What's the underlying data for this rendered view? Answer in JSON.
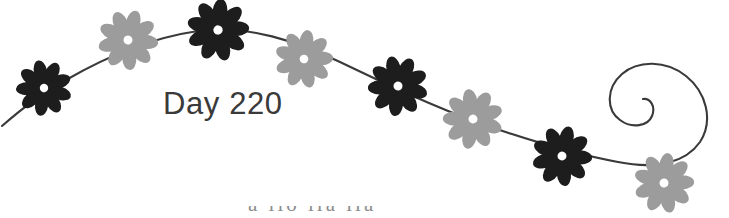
{
  "banner": {
    "title_text": "Day 220",
    "partial_footer_text": "a llo   lla  lla",
    "colors": {
      "background": "#ffffff",
      "dark_flower": "#1d1d1d",
      "light_flower": "#9c9c9c",
      "flower_center": "#ffffff",
      "vine_stroke": "#3a3a3a",
      "title_text": "#3a3a3a"
    },
    "vine": {
      "description": "s-curve-with-spiral",
      "path": "M 2 126 C 18 112 40 94 66 80 C 104 58 150 38 198 31 C 248 24 298 42 340 62 C 386 84 432 106 482 124 C 528 140 574 154 618 162 C 658 170 686 162 700 142 C 714 120 706 92 686 76 C 666 60 638 60 622 74 C 606 88 606 110 620 120 C 632 129 648 126 652 116 C 656 106 650 98 643 99",
      "stroke_width": 2.1
    },
    "flowers": [
      {
        "name": "flower-1",
        "cx": 44,
        "cy": 88,
        "r": 27,
        "petals": 9,
        "tone": "dark"
      },
      {
        "name": "flower-2",
        "cx": 128,
        "cy": 40,
        "r": 29,
        "petals": 9,
        "tone": "light"
      },
      {
        "name": "flower-3",
        "cx": 218,
        "cy": 30,
        "r": 30,
        "petals": 9,
        "tone": "dark"
      },
      {
        "name": "flower-4",
        "cx": 304,
        "cy": 59,
        "r": 28,
        "petals": 9,
        "tone": "light"
      },
      {
        "name": "flower-5",
        "cx": 398,
        "cy": 86,
        "r": 29,
        "petals": 9,
        "tone": "dark"
      },
      {
        "name": "flower-6",
        "cx": 473,
        "cy": 119,
        "r": 29,
        "petals": 9,
        "tone": "light"
      },
      {
        "name": "flower-7",
        "cx": 562,
        "cy": 156,
        "r": 29,
        "petals": 9,
        "tone": "dark"
      },
      {
        "name": "flower-8",
        "cx": 664,
        "cy": 183,
        "r": 29,
        "petals": 9,
        "tone": "light"
      }
    ]
  }
}
